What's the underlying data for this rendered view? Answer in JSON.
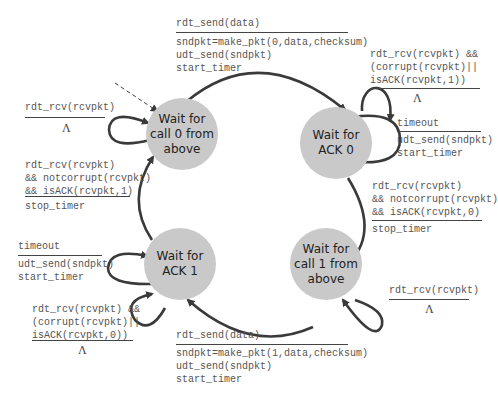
{
  "states": [
    {
      "id": "s0",
      "label": "Wait for call 0 from above",
      "lines": [
        "Wait for",
        "call 0 from",
        "above"
      ]
    },
    {
      "id": "s1",
      "label": "Wait for ACK 0",
      "lines": [
        "Wait for",
        "ACK 0"
      ]
    },
    {
      "id": "s2",
      "label": "Wait for call 1 from above",
      "lines": [
        "Wait for",
        "call 1 from",
        "above"
      ]
    },
    {
      "id": "s3",
      "label": "Wait for ACK 1",
      "lines": [
        "Wait for",
        "ACK 1"
      ]
    }
  ],
  "transitions": {
    "t_s0_s1": {
      "event": "rdt_send(data)",
      "actions": "sndpkt=make_pkt(0,data,checksum)\nudt_send(sndpkt)\nstart_timer"
    },
    "t_s1_self_rcv": {
      "event": "rdt_rcv(rcvpkt) &&\n(corrupt(rcvpkt)||\nisACK(rcvpkt,1))",
      "actions": "Λ"
    },
    "t_s1_self_timeout": {
      "event": "timeout",
      "actions": "udt_send(sndpkt)\nstart_timer"
    },
    "t_s1_s2": {
      "event": "rdt_rcv(rcvpkt)\n&& notcorrupt(rcvpkt)\n&& isACK(rcvpkt,0)",
      "actions": "stop_timer"
    },
    "t_s2_self": {
      "event": "rdt_rcv(rcvpkt)",
      "actions": "Λ"
    },
    "t_s2_s3": {
      "event": "rdt_send(data)",
      "actions": "sndpkt=make_pkt(1,data,checksum)\nudt_send(sndpkt)\nstart_timer"
    },
    "t_s3_self_timeout": {
      "event": "timeout",
      "actions": "udt_send(sndpkt)\nstart_timer"
    },
    "t_s3_self_rcv": {
      "event": "rdt_rcv(rcvpkt) &&\n(corrupt(rcvpkt)||\nisACK(rcvpkt,0))",
      "actions": "Λ"
    },
    "t_s3_s0": {
      "event": "rdt_rcv(rcvpkt)\n&& notcorrupt(rcvpkt)\n&& isACK(rcvpkt,1)",
      "actions": "stop_timer"
    },
    "t_s0_self": {
      "event": "rdt_rcv(rcvpkt)",
      "actions": "Λ"
    }
  },
  "colors": {
    "state_fill": "#c9c9c9",
    "arrow": "#3a3a3a",
    "text": "#555555"
  }
}
